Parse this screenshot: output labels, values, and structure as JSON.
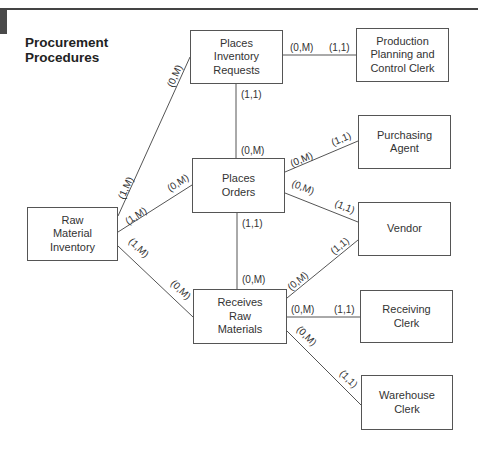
{
  "title": [
    "Procurement",
    "Procedures"
  ],
  "entities": {
    "places_inventory_requests": [
      "Places",
      "Inventory",
      "Requests"
    ],
    "production_planning": [
      "Production",
      "Planning and",
      "Control Clerk"
    ],
    "places_orders": [
      "Places",
      "Orders"
    ],
    "purchasing_agent": [
      "Purchasing",
      "Agent"
    ],
    "vendor": [
      "Vendor"
    ],
    "raw_material_inventory": [
      "Raw",
      "Material",
      "Inventory"
    ],
    "receives_raw_materials": [
      "Receives",
      "Raw",
      "Materials"
    ],
    "receiving_clerk": [
      "Receiving",
      "Clerk"
    ],
    "warehouse_clerk": [
      "Warehouse",
      "Clerk"
    ]
  },
  "relationships": [
    {
      "from": "Places Inventory Requests",
      "to": "Production Planning and Control Clerk",
      "from_card": "(0,M)",
      "to_card": "(1,1)"
    },
    {
      "from": "Places Inventory Requests",
      "to": "Places Orders",
      "from_card": "(1,1)",
      "to_card": "(0,M)"
    },
    {
      "from": "Raw Material Inventory",
      "to": "Places Inventory Requests",
      "from_card": "(1,M)",
      "to_card": "(0,M)"
    },
    {
      "from": "Raw Material Inventory",
      "to": "Places Orders",
      "from_card": "(1,M)",
      "to_card": "(0,M)"
    },
    {
      "from": "Raw Material Inventory",
      "to": "Receives Raw Materials",
      "from_card": "(1,M)",
      "to_card": "(0,M)"
    },
    {
      "from": "Places Orders",
      "to": "Purchasing Agent",
      "from_card": "(0,M)",
      "to_card": "(1,1)"
    },
    {
      "from": "Places Orders",
      "to": "Vendor",
      "from_card": "(0,M)",
      "to_card": "(1,1)"
    },
    {
      "from": "Places Orders",
      "to": "Receives Raw Materials",
      "from_card": "(1,1)",
      "to_card": "(0,M)"
    },
    {
      "from": "Receives Raw Materials",
      "to": "Vendor",
      "from_card": "(0,M)",
      "to_card": "(1,1)"
    },
    {
      "from": "Receives Raw Materials",
      "to": "Receiving Clerk",
      "from_card": "(0,M)",
      "to_card": "(1,1)"
    },
    {
      "from": "Receives Raw Materials",
      "to": "Warehouse Clerk",
      "from_card": "(0,M)",
      "to_card": "(1,1)"
    }
  ],
  "labels": {
    "zero_m": "(0,M)",
    "one_one": "(1,1)",
    "one_m": "(1,M)"
  }
}
